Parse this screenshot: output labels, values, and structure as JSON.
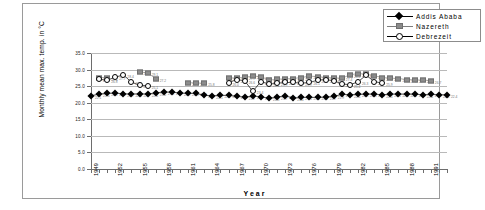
{
  "chart_data": {
    "type": "line",
    "title": "",
    "xlabel": "Year",
    "ylabel": "Monthly mean max. temp. in °C",
    "xlim": [
      1949,
      1993
    ],
    "ylim": [
      0,
      35
    ],
    "grid": true,
    "legend_position": "top-right",
    "ytick_labels": [
      "35.0",
      "30.0",
      "25.0",
      "20.0",
      "15.0",
      "10.0",
      "5.0",
      "0.0"
    ],
    "ytick_values": [
      35,
      30,
      25,
      20,
      15,
      10,
      5,
      0
    ],
    "xtick_labels": [
      "1949",
      "1952",
      "1955",
      "1958",
      "1961",
      "1964",
      "1967",
      "1970",
      "1973",
      "1976",
      "1979",
      "1982",
      "1985",
      "1988",
      "1991"
    ],
    "xtick_values": [
      1949,
      1952,
      1955,
      1958,
      1961,
      1964,
      1967,
      1970,
      1973,
      1976,
      1979,
      1982,
      1985,
      1988,
      1991
    ],
    "series": [
      {
        "name": "Addis Ababa",
        "marker": "diamond",
        "color": "#000000",
        "x": [
          1949,
          1950,
          1951,
          1952,
          1953,
          1954,
          1955,
          1956,
          1957,
          1958,
          1959,
          1960,
          1961,
          1962,
          1963,
          1964,
          1965,
          1966,
          1967,
          1968,
          1969,
          1970,
          1971,
          1972,
          1973,
          1974,
          1975,
          1976,
          1977,
          1978,
          1979,
          1980,
          1981,
          1982,
          1983,
          1984,
          1985,
          1986,
          1987,
          1988,
          1989,
          1990,
          1991,
          1992,
          1993
        ],
        "values": [
          22.1,
          22.6,
          22.8,
          22.9,
          22.7,
          22.6,
          22.7,
          22.6,
          23.0,
          23.2,
          23.2,
          22.9,
          22.8,
          22.8,
          22.2,
          22.1,
          22.2,
          22.2,
          21.9,
          21.7,
          22.0,
          21.8,
          21.3,
          21.7,
          22.1,
          21.4,
          21.6,
          21.6,
          21.6,
          21.7,
          21.9,
          22.5,
          22.4,
          22.5,
          22.6,
          22.6,
          22.4,
          22.6,
          22.6,
          22.6,
          22.6,
          22.4,
          22.5,
          22.4,
          22.4
        ]
      },
      {
        "name": "Nazereth",
        "marker": "square",
        "color": "#8c8c8c",
        "x": [
          1950,
          1951,
          1955,
          1956,
          1957,
          1961,
          1962,
          1963,
          1966,
          1967,
          1968,
          1969,
          1970,
          1971,
          1972,
          1973,
          1974,
          1975,
          1976,
          1977,
          1978,
          1979,
          1980,
          1981,
          1982,
          1983,
          1984,
          1985,
          1986,
          1987,
          1988,
          1989,
          1990,
          1991
        ],
        "values": [
          27.6,
          27.6,
          29.2,
          29.1,
          27.2,
          26.0,
          26.0,
          25.8,
          27.5,
          27.5,
          27.7,
          28.0,
          27.9,
          26.8,
          27.1,
          27.2,
          27.3,
          27.6,
          28.0,
          27.9,
          27.6,
          27.5,
          27.4,
          28.4,
          28.8,
          28.6,
          28.1,
          27.6,
          27.4,
          27.3,
          27.0,
          26.9,
          26.8,
          26.7
        ]
      },
      {
        "name": "Debrezeit",
        "marker": "circle",
        "color": "#000000",
        "x": [
          1950,
          1951,
          1952,
          1953,
          1954,
          1955,
          1956,
          1966,
          1967,
          1968,
          1969,
          1970,
          1971,
          1972,
          1973,
          1974,
          1975,
          1976,
          1977,
          1978,
          1979,
          1980,
          1981,
          1982,
          1983,
          1984,
          1985
        ],
        "values": [
          27.1,
          26.8,
          27.7,
          28.4,
          26.2,
          25.3,
          25.1,
          26.0,
          27.0,
          26.6,
          23.4,
          26.4,
          25.6,
          25.9,
          26.1,
          26.1,
          25.9,
          26.1,
          26.8,
          27.0,
          26.6,
          25.7,
          25.4,
          26.3,
          28.3,
          26.4,
          25.9
        ]
      }
    ]
  },
  "legend": {
    "items": [
      {
        "label": "Addis Ababa",
        "marker": "diamond"
      },
      {
        "label": "Nazereth",
        "marker": "square"
      },
      {
        "label": "Debrezeit",
        "marker": "circle"
      }
    ]
  }
}
